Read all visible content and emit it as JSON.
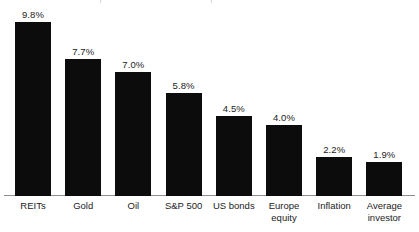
{
  "chart_data": {
    "type": "bar",
    "title": "",
    "subtitle": "",
    "xlabel": "",
    "ylabel": "",
    "ylim": [
      0,
      10.5
    ],
    "grid": false,
    "legend": "none",
    "value_suffix": "%",
    "bar_color": "#0c0c0c",
    "axis_color": "#8f8f8f",
    "background": "#ffffff",
    "categories": [
      "REITs",
      "Gold",
      "Oil",
      "S&P 500",
      "US bonds",
      "Europe\nequity",
      "Inflation",
      "Average\ninvestor"
    ],
    "values": [
      9.8,
      7.7,
      7.0,
      5.8,
      4.5,
      4.0,
      2.2,
      1.9
    ],
    "value_labels": [
      "9.8%",
      "7.7%",
      "7.0%",
      "5.8%",
      "4.5%",
      "4.0%",
      "2.2%",
      "1.9%"
    ]
  }
}
